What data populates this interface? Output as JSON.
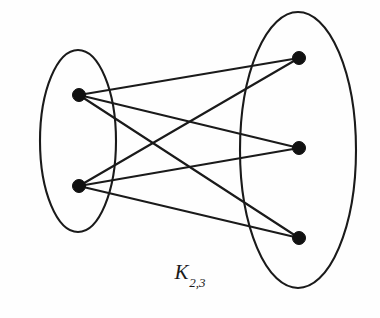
{
  "figure": {
    "name": "complete-bipartite-graph-k-2-3",
    "label_base": "K",
    "label_subscript": "2,3",
    "background_color": "#fefefe",
    "ink_color": "#1a1a1a",
    "vertex_color": "#111111"
  },
  "chart_data": {
    "type": "diagram",
    "diagram_kind": "complete-bipartite-graph",
    "title": "K2,3",
    "notation": "K_{2,3}",
    "parts": [
      {
        "name": "left-part",
        "size": 2,
        "ellipse": {
          "cx": 78,
          "cy": 141,
          "rx": 38,
          "ry": 91
        }
      },
      {
        "name": "right-part",
        "size": 3,
        "ellipse": {
          "cx": 298,
          "cy": 150,
          "rx": 58,
          "ry": 138
        }
      }
    ],
    "vertices": [
      {
        "id": "u1",
        "part": "left-part",
        "cx": 79,
        "cy": 95,
        "r": 6.5
      },
      {
        "id": "u2",
        "part": "left-part",
        "cx": 79,
        "cy": 186,
        "r": 6.5
      },
      {
        "id": "v1",
        "part": "right-part",
        "cx": 299,
        "cy": 58,
        "r": 6.5
      },
      {
        "id": "v2",
        "part": "right-part",
        "cx": 299,
        "cy": 148,
        "r": 6.5
      },
      {
        "id": "v3",
        "part": "right-part",
        "cx": 299,
        "cy": 238,
        "r": 6.5
      }
    ],
    "edges": [
      {
        "id": "e1",
        "from": "u1",
        "to": "v1"
      },
      {
        "id": "e2",
        "from": "u1",
        "to": "v2"
      },
      {
        "id": "e3",
        "from": "u1",
        "to": "v3"
      },
      {
        "id": "e4",
        "from": "u2",
        "to": "v1"
      },
      {
        "id": "e5",
        "from": "u2",
        "to": "v2"
      },
      {
        "id": "e6",
        "from": "u2",
        "to": "v3"
      }
    ],
    "edge_count": 6,
    "vertex_count": 5
  }
}
